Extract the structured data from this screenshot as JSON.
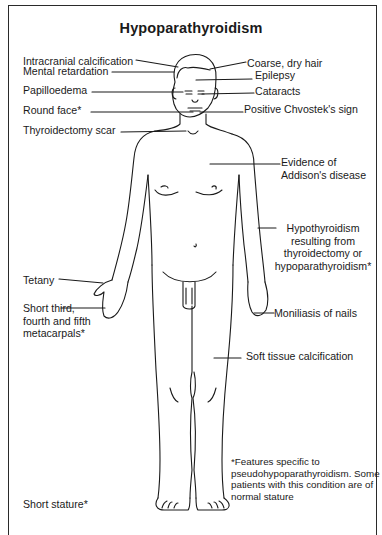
{
  "title": "Hypoparathyroidism",
  "labels_left": [
    {
      "id": "intracranial",
      "text": "Intracranial calcification"
    },
    {
      "id": "mental",
      "text": "Mental retardation"
    },
    {
      "id": "papilloedema",
      "text": "Papilloedema"
    },
    {
      "id": "round_face",
      "text": "Round face*"
    },
    {
      "id": "thyroid_scar",
      "text": "Thyroidectomy scar"
    },
    {
      "id": "tetany",
      "text": "Tetany"
    },
    {
      "id": "short_meta",
      "lines": [
        "Short third,",
        "fourth and fifth",
        "metacarpals*"
      ]
    },
    {
      "id": "short_stature",
      "text": "Short stature*"
    }
  ],
  "labels_right": [
    {
      "id": "coarse_hair",
      "text": "Coarse, dry hair"
    },
    {
      "id": "epilepsy",
      "text": "Epilepsy"
    },
    {
      "id": "cataracts",
      "text": "Cataracts"
    },
    {
      "id": "chvostek",
      "text": "Positive Chvostek's sign"
    },
    {
      "id": "addison",
      "lines": [
        "Evidence of",
        "Addison's disease"
      ]
    },
    {
      "id": "hypothyroid",
      "lines": [
        "Hypothyroidism",
        "resulting from",
        "thyroidectomy or",
        "hypoparathyroidism*"
      ]
    },
    {
      "id": "moniliasis",
      "text": "Moniliasis of nails"
    },
    {
      "id": "soft_tissue",
      "text": "Soft tissue calcification"
    }
  ],
  "footnote": [
    "*Features specific to",
    "pseudohypoparathyroidism. Some",
    "patients with this condition are of",
    "normal stature"
  ],
  "colors": {
    "line": "#1a1a1a",
    "border": "#2a2a2a",
    "background": "#ffffff"
  }
}
